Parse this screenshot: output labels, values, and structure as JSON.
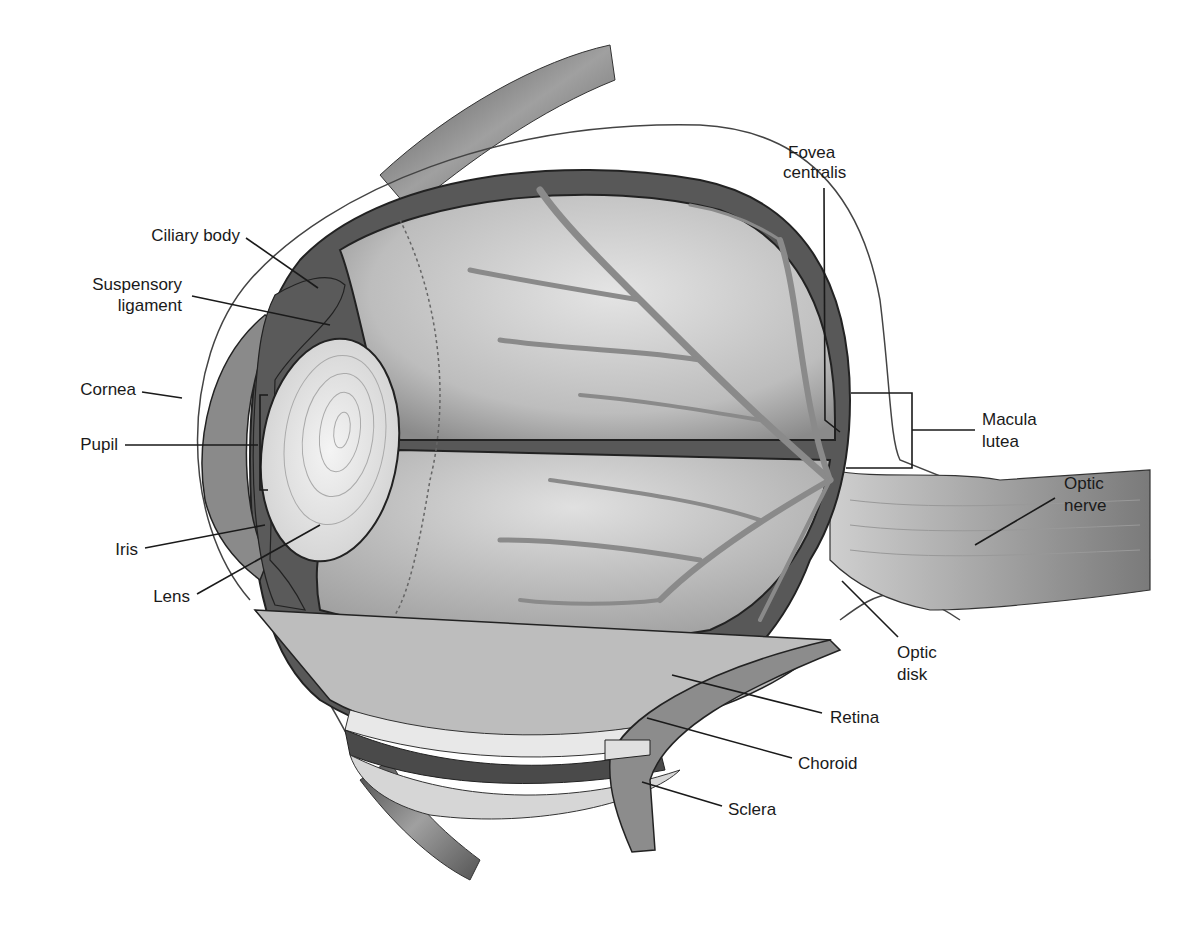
{
  "diagram": {
    "labels": {
      "ciliary_body": "Ciliary body",
      "suspensory_ligament_1": "Suspensory",
      "suspensory_ligament_2": "ligament",
      "cornea": "Cornea",
      "pupil": "Pupil",
      "iris": "Iris",
      "lens": "Lens",
      "fovea_1": "Fovea",
      "fovea_2": "centralis",
      "macula_1": "Macula",
      "macula_2": "lutea",
      "optic_nerve_1": "Optic",
      "optic_nerve_2": "nerve",
      "optic_disk_1": "Optic",
      "optic_disk_2": "disk",
      "retina": "Retina",
      "choroid": "Choroid",
      "sclera": "Sclera"
    },
    "colors": {
      "background": "#ffffff",
      "text": "#1a1a1a",
      "sclera_dark": "#555555",
      "vitreous": "#c8c8c8",
      "vessels": "#8a8a8a",
      "lens": "#e6e6e6"
    }
  }
}
